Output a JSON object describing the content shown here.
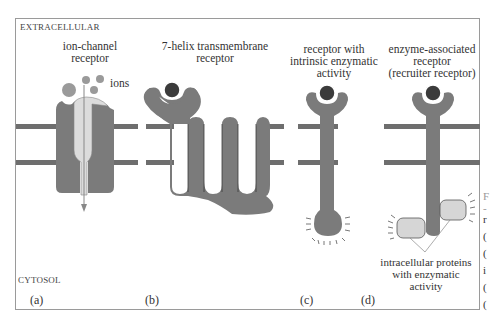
{
  "regions": {
    "extracellular": "EXTRACELLULAR",
    "cytosol": "CYTOSOL"
  },
  "receptors": [
    {
      "id": "a",
      "panel_label": "(a)",
      "title_lines": [
        "ion-channel",
        "receptor"
      ],
      "annotation": "ions"
    },
    {
      "id": "b",
      "panel_label": "(b)",
      "title_lines": [
        "7-helix transmembrane",
        "receptor"
      ]
    },
    {
      "id": "c",
      "panel_label": "(c)",
      "title_lines": [
        "receptor with",
        "intrinsic enzymatic",
        "activity"
      ]
    },
    {
      "id": "d",
      "panel_label": "(d)",
      "title_lines": [
        "enzyme-associated",
        "receptor",
        "(recruiter receptor)"
      ],
      "annotation_lines": [
        "intracellular proteins",
        "with enzymatic",
        "activity"
      ]
    }
  ],
  "edge_fragments": [
    "F",
    "-",
    "r",
    "(",
    "(",
    "i",
    "(",
    "("
  ],
  "colors": {
    "protein": "#7b7b7b",
    "ligand": "#3b3b3b",
    "ion": "#9a9a9a",
    "channel_pore": "#dcdcdc",
    "enzyme": "#d6d6d6",
    "membrane": "#6e6e6e",
    "frame": "#9a9a9a"
  }
}
